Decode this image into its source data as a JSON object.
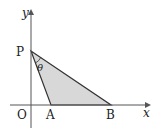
{
  "diagram": {
    "type": "coordinate-geometry",
    "axes": {
      "x_label": "x",
      "y_label": "y",
      "origin_label": "O"
    },
    "points": [
      {
        "name": "P",
        "label": "P",
        "position": "on y-axis"
      },
      {
        "name": "A",
        "label": "A",
        "position": "on x-axis"
      },
      {
        "name": "B",
        "label": "B",
        "position": "on x-axis"
      }
    ],
    "angle": {
      "label": "θ",
      "vertex": "P",
      "between": [
        "A",
        "B"
      ]
    },
    "shaded_region": "triangle PAB",
    "colors": {
      "fill": "#d8d8d8",
      "stroke": "#333333",
      "axis": "#555555"
    }
  }
}
